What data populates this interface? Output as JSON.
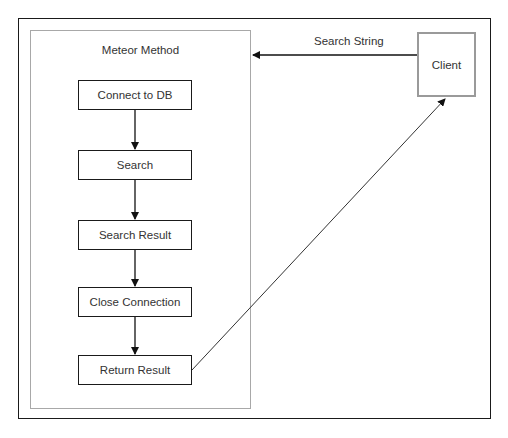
{
  "diagram": {
    "container": {
      "title": "Meteor Method"
    },
    "steps": [
      {
        "label": "Connect to DB"
      },
      {
        "label": "Search"
      },
      {
        "label": "Search Result"
      },
      {
        "label": "Close Connection"
      },
      {
        "label": "Return Result"
      }
    ],
    "client": {
      "label": "Client"
    },
    "edges": [
      {
        "from": "Client",
        "to": "Meteor Method",
        "label": "Search String"
      },
      {
        "from": "Connect to DB",
        "to": "Search"
      },
      {
        "from": "Search",
        "to": "Search Result"
      },
      {
        "from": "Search Result",
        "to": "Close Connection"
      },
      {
        "from": "Close Connection",
        "to": "Return Result"
      },
      {
        "from": "Return Result",
        "to": "Client"
      }
    ]
  }
}
